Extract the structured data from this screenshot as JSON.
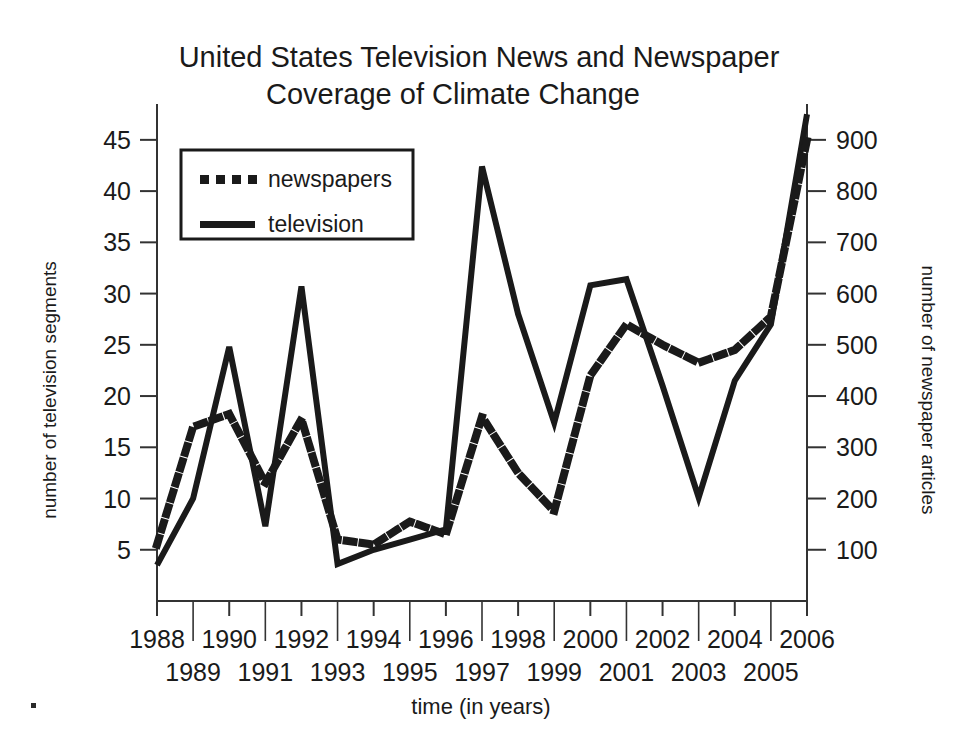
{
  "figure": {
    "title_line1": "United States Television News and Newspaper",
    "title_line2": "Coverage of Climate Change",
    "background_color": "#ffffff",
    "ink_color": "#1a1a1a"
  },
  "legend": {
    "position": "top-left-inside",
    "entries": [
      {
        "label": "newspapers",
        "style": "dotted",
        "axis": "right"
      },
      {
        "label": "television",
        "style": "solid",
        "axis": "left"
      }
    ]
  },
  "axes": {
    "left": {
      "label": "number of television segments",
      "ticks": [
        5,
        10,
        15,
        20,
        25,
        30,
        35,
        40,
        45
      ],
      "range": [
        0,
        48.5
      ]
    },
    "right": {
      "label": "number of newspaper articles",
      "ticks": [
        100,
        200,
        300,
        400,
        500,
        600,
        700,
        800,
        900
      ],
      "range": [
        0,
        970
      ]
    },
    "bottom": {
      "label": "time (in years)",
      "ticks_top_row": [
        "1988",
        "1990",
        "1992",
        "1994",
        "1996",
        "1998",
        "2000",
        "2002",
        "2004",
        "2006"
      ],
      "ticks_bottom_row": [
        "1989",
        "1991",
        "1993",
        "1995",
        "1997",
        "1999",
        "2001",
        "2003",
        "2005"
      ],
      "range": [
        1988,
        2006
      ]
    }
  },
  "chart_data": {
    "type": "line",
    "title": "United States Television News and Newspaper Coverage of Climate Change",
    "xlabel": "time (in years)",
    "ylabel": "number of television segments",
    "y2label": "number of newspaper articles",
    "grid": false,
    "legend_position": "upper left",
    "x": [
      1988,
      1989,
      1990,
      1991,
      1992,
      1993,
      1994,
      1995,
      1996,
      1997,
      1998,
      1999,
      2000,
      2001,
      2002,
      2003,
      2004,
      2005,
      2006
    ],
    "xlim": [
      1988,
      2006
    ],
    "ylim": [
      0,
      48.5
    ],
    "y2lim": [
      0,
      970
    ],
    "series": [
      {
        "name": "television",
        "axis": "left",
        "style": "solid",
        "values": [
          3.5,
          10,
          24.8,
          7.3,
          30.7,
          3.6,
          5,
          6,
          7,
          42.4,
          28,
          17.4,
          30.8,
          31.4,
          21,
          10.1,
          21.5,
          27,
          47.5
        ]
      },
      {
        "name": "newspapers",
        "axis": "right",
        "style": "dotted",
        "values": [
          110,
          340,
          365,
          230,
          355,
          120,
          110,
          155,
          130,
          360,
          250,
          175,
          440,
          540,
          500,
          465,
          490,
          555,
          900
        ]
      }
    ]
  }
}
